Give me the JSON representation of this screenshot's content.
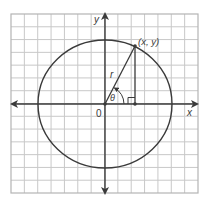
{
  "diagram": {
    "type": "unit-circle-coordinate-diagram",
    "colors": {
      "background": "#ffffff",
      "grid": "#c8c8c8",
      "grid_border": "#b4b4b4",
      "ink": "#3a3a3a"
    },
    "grid": {
      "x0": 11,
      "y0": 14,
      "x1": 198,
      "y1": 193,
      "cols": 14,
      "rows": 14
    },
    "origin": {
      "x": 105,
      "y": 104
    },
    "circle": {
      "cx": 105,
      "cy": 104,
      "rx": 67,
      "ry": 64
    },
    "labels": {
      "y_axis": "y",
      "x_axis": "x",
      "origin": "0",
      "point": "(x, y)",
      "radius": "r",
      "angle": "θ"
    },
    "point_on_circle": {
      "x": 135,
      "y": 46
    },
    "foot_of_perpendicular": {
      "x": 135,
      "y": 104
    }
  }
}
